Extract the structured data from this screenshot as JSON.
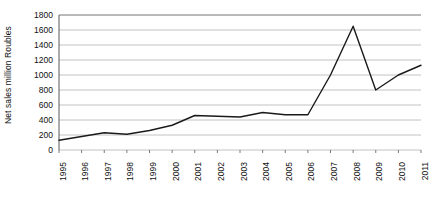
{
  "chart_data": {
    "type": "line",
    "title": "",
    "xlabel": "",
    "ylabel": "Net sales million Roubles",
    "ylim": [
      0,
      1800
    ],
    "ytick_step": 200,
    "yticks": [
      1800,
      1600,
      1400,
      1200,
      1000,
      800,
      600,
      400,
      200,
      0
    ],
    "grid": "horizontal",
    "legend": "none",
    "line_color": "#1a1a1a",
    "grid_color": "#b3b3b3",
    "axis_color": "#808080",
    "background_color": "#ffffff",
    "categories": [
      "1995",
      "1996",
      "1997",
      "1998",
      "1999",
      "2000",
      "2001",
      "2002",
      "2003",
      "2004",
      "2005",
      "2006",
      "2007",
      "2008",
      "2009",
      "2010",
      "2011"
    ],
    "values": [
      130,
      180,
      230,
      210,
      260,
      330,
      460,
      450,
      440,
      500,
      470,
      470,
      1000,
      1650,
      800,
      1000,
      1130
    ],
    "series": [
      {
        "name": "Net sales",
        "values": [
          130,
          180,
          230,
          210,
          260,
          330,
          460,
          450,
          440,
          500,
          470,
          470,
          1000,
          1650,
          800,
          1000,
          1130
        ]
      }
    ]
  }
}
